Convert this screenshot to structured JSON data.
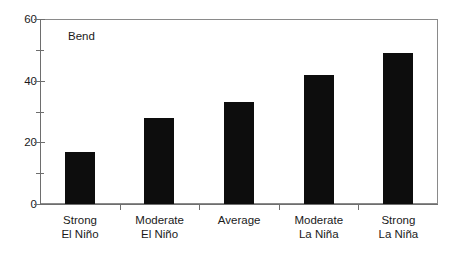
{
  "chart_data": {
    "type": "bar",
    "title": "",
    "subtitle": "",
    "xlabel": "",
    "ylabel": "",
    "ylim": [
      0,
      60
    ],
    "yticks": [
      0,
      20,
      40,
      60
    ],
    "yminorticks": [
      10,
      30,
      50
    ],
    "grid": false,
    "legend": null,
    "annotations": [
      {
        "text": "Bend",
        "position": "upper-left-inside-plot"
      }
    ],
    "bar_color": "#0d0d0d",
    "axis_color": "#6e6e6e",
    "background_color": "#ffffff",
    "categories": [
      "Strong El Niño",
      "Moderate El Niño",
      "Average",
      "Moderate La Niña",
      "Strong La Niña"
    ],
    "category_lines": [
      [
        "Strong",
        "El Niño"
      ],
      [
        "Moderate",
        "El Niño"
      ],
      [
        "Average",
        ""
      ],
      [
        "Moderate",
        "La Niña"
      ],
      [
        "Strong",
        "La Niña"
      ]
    ],
    "values": [
      17,
      28,
      33,
      42,
      49
    ]
  },
  "axis": {
    "y_tick_labels": [
      "0",
      "20",
      "40",
      "60"
    ]
  }
}
